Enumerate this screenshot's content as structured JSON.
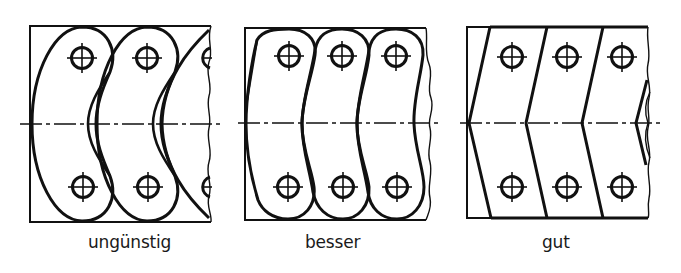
{
  "figure": {
    "colors": {
      "line": "#111111",
      "background": "#ffffff"
    },
    "panels": [
      {
        "id": "panel-1",
        "label": "ungünstig",
        "shape": "crescent links",
        "holes_per_row": 2,
        "partial_link": true
      },
      {
        "id": "panel-2",
        "label": "besser",
        "shape": "curved links",
        "holes_per_row": 3
      },
      {
        "id": "panel-3",
        "label": "gut",
        "shape": "chevron links",
        "holes_per_row": 3
      }
    ]
  }
}
